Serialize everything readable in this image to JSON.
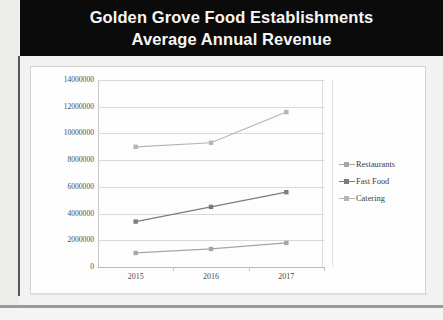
{
  "slide": {
    "title_line_1": "Golden Grove Food Establishments",
    "title_line_2": "Average Annual Revenue",
    "title_background": "#0b0b0b",
    "title_color": "#f6f6f4"
  },
  "chart_data": {
    "type": "line",
    "title": "Golden Grove Food Establishments Average Annual Revenue",
    "xlabel": "",
    "ylabel": "",
    "categories": [
      "2015",
      "2016",
      "2017"
    ],
    "ylim": [
      0,
      14000000
    ],
    "ytick_labels": [
      "14000000",
      "12000000",
      "10000000",
      "8000000",
      "6000000",
      "4000000",
      "2000000",
      "0"
    ],
    "ytick_values": [
      14000000,
      12000000,
      10000000,
      8000000,
      6000000,
      4000000,
      2000000,
      0
    ],
    "grid": true,
    "legend_position": "right",
    "series": [
      {
        "name": "Restaurants",
        "color": "#a6a6a6",
        "marker": "square",
        "values": [
          1050000,
          1350000,
          1800000
        ]
      },
      {
        "name": "Fast Food",
        "color": "#7c7c7c",
        "marker": "square",
        "values": [
          3400000,
          4500000,
          5600000
        ]
      },
      {
        "name": "Catering",
        "color": "#b4b4b4",
        "marker": "square",
        "values": [
          9000000,
          9300000,
          11600000
        ]
      }
    ]
  }
}
